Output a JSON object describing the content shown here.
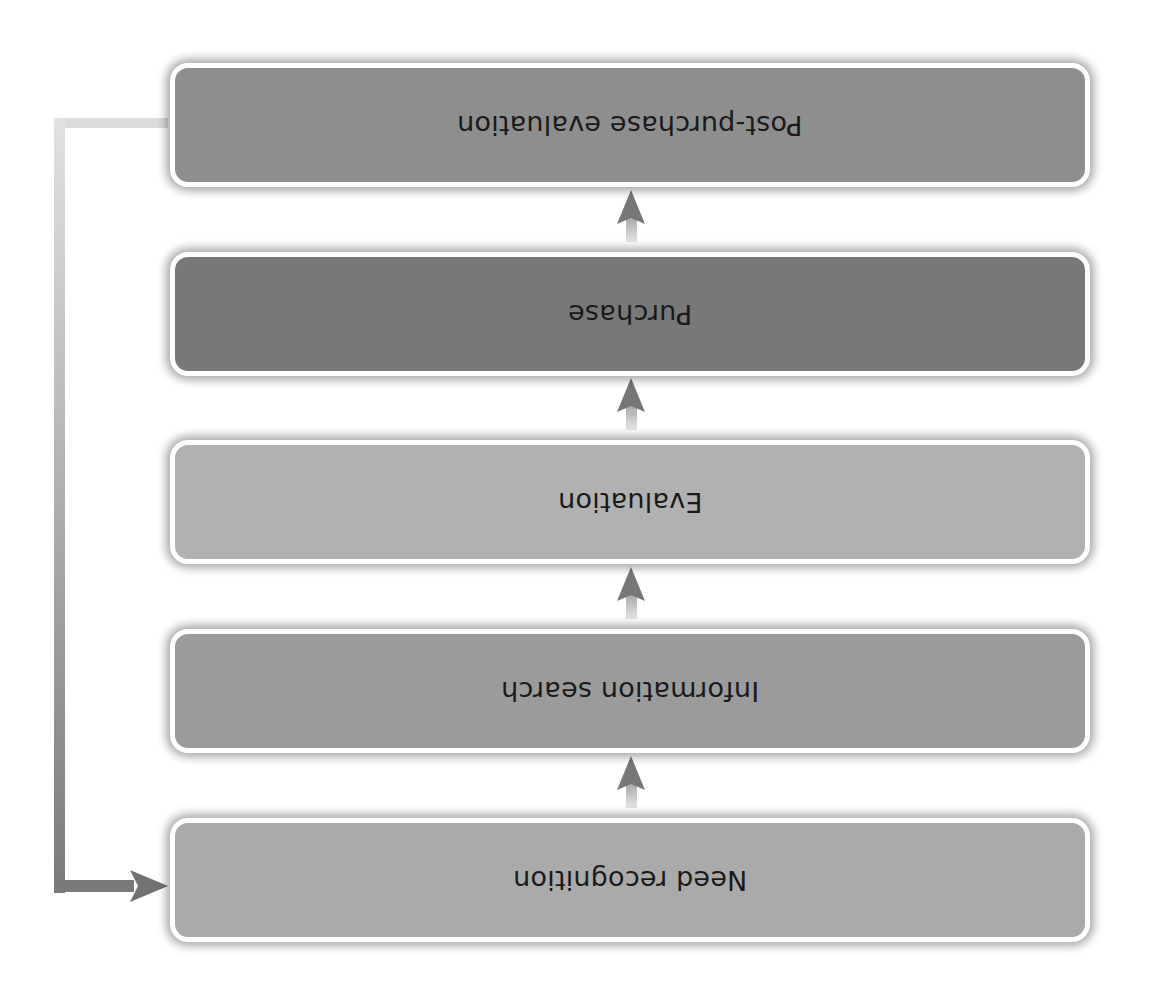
{
  "diagram": {
    "title": "",
    "orientation": "rotated-180",
    "stages": [
      {
        "label": "Post-purchase evaluation",
        "fill": "#8e8e8e",
        "top": 63
      },
      {
        "label": "Purchase",
        "fill": "#787878",
        "top": 252
      },
      {
        "label": "Evaluation",
        "fill": "#b1b1b1",
        "top": 440
      },
      {
        "label": "Information search",
        "fill": "#9b9b9b",
        "top": 629
      },
      {
        "label": "Need recognition",
        "fill": "#aaaaaa",
        "top": 818
      }
    ],
    "flow": "Need recognition → Information search → Evaluation → Purchase → Post-purchase evaluation",
    "feedback": {
      "from": "Post-purchase evaluation",
      "to": "Need recognition"
    },
    "colors": {
      "border": "#ffffff",
      "arrow": "#7a7a7a",
      "feedback_light": "#dadada",
      "feedback_dark": "#7d7d7d",
      "text": "#1a1a1a"
    }
  }
}
